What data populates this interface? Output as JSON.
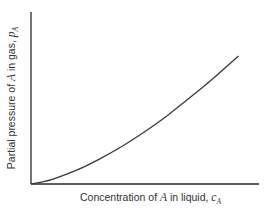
{
  "chart_data": {
    "type": "line",
    "title": "",
    "xlabel": "Concentration of A in liquid, c_A",
    "ylabel": "Partial pressure of A in gas, p_A",
    "xlabel_parts": {
      "prefix": "Concentration of ",
      "var": "A",
      "middle": " in liquid, ",
      "sym": "c",
      "sub": "A"
    },
    "ylabel_parts": {
      "prefix": "Partial pressure of ",
      "var": "A",
      "middle": " in gas, ",
      "sym": "p",
      "sub": "A"
    },
    "ticks": {
      "x": [],
      "y": []
    },
    "grid": false,
    "legend": null,
    "xlim": [
      0,
      1
    ],
    "ylim": [
      0,
      1
    ],
    "series": [
      {
        "name": "Equilibrium curve p_A vs c_A",
        "color": "#3a3a3a",
        "x": [
          0.0,
          0.05,
          0.1,
          0.2,
          0.3,
          0.4,
          0.5,
          0.6,
          0.7,
          0.8,
          0.91
        ],
        "y": [
          0.0,
          0.012,
          0.03,
          0.08,
          0.145,
          0.22,
          0.305,
          0.4,
          0.505,
          0.615,
          0.745
        ]
      }
    ]
  },
  "colors": {
    "axis": "#2a2a2a",
    "curve": "#3a3a3a",
    "text": "#333333",
    "background": "#ffffff"
  }
}
